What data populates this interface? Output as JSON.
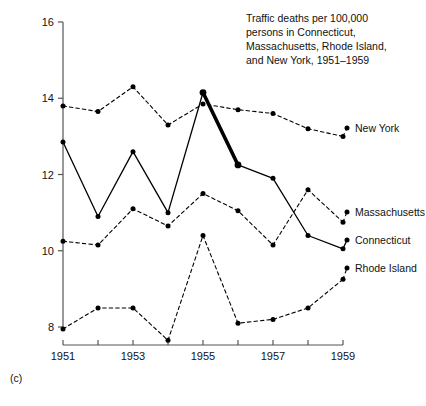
{
  "figure": {
    "panel_label": "(c)",
    "title_lines": [
      "Traffic deaths per 100,000",
      "persons in Connecticut,",
      "Massachusetts, Rhode Island,",
      "and New York, 1951–1959"
    ],
    "axis_color": "#555555",
    "ink_color": "#000000",
    "background": "#ffffff"
  },
  "chart_data": {
    "type": "line",
    "title": "Traffic deaths per 100,000 persons in Connecticut, Massachusetts, Rhode Island, and New York, 1951–1959",
    "xlabel": "",
    "ylabel": "",
    "x": [
      1951,
      1952,
      1953,
      1954,
      1955,
      1956,
      1957,
      1958,
      1959
    ],
    "xlim": [
      1951,
      1959
    ],
    "ylim": [
      8,
      16
    ],
    "xticks": [
      1951,
      1952,
      1953,
      1954,
      1955,
      1956,
      1957,
      1958,
      1959
    ],
    "xtick_labels": [
      "1951",
      "",
      "1953",
      "",
      "1955",
      "",
      "1957",
      "",
      "1959"
    ],
    "yticks": [
      8,
      10,
      12,
      14,
      16
    ],
    "ytick_labels": [
      "8",
      "10",
      "12",
      "14",
      "16"
    ],
    "grid": false,
    "legend": "right-of-line-ends",
    "series": [
      {
        "name": "New York",
        "style": "dashed",
        "values": [
          13.8,
          13.65,
          14.3,
          13.3,
          13.85,
          13.7,
          13.6,
          13.2,
          13.0
        ]
      },
      {
        "name": "Connecticut",
        "style": "solid",
        "highlight_segment": [
          1955,
          1956
        ],
        "values": [
          12.85,
          10.9,
          12.6,
          11.0,
          14.15,
          12.25,
          11.9,
          10.4,
          10.05
        ]
      },
      {
        "name": "Massachusetts",
        "style": "dashed",
        "values": [
          10.25,
          10.15,
          11.1,
          10.65,
          11.5,
          11.05,
          10.15,
          11.6,
          10.75
        ]
      },
      {
        "name": "Rhode Island",
        "style": "dashed",
        "values": [
          7.95,
          8.5,
          8.5,
          7.65,
          10.4,
          8.1,
          8.2,
          8.5,
          9.25
        ]
      }
    ]
  }
}
